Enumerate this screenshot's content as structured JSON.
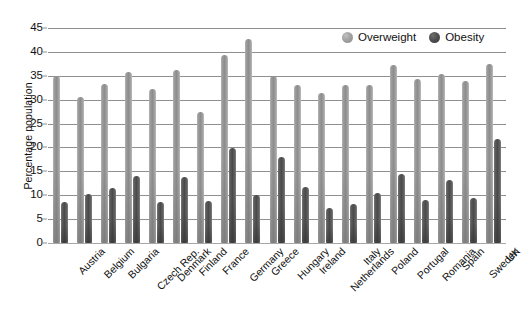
{
  "chart_data": {
    "type": "bar",
    "title": "",
    "xlabel": "",
    "ylabel": "Percentage population",
    "ylim": [
      0,
      45
    ],
    "yticks": [
      0,
      5,
      10,
      15,
      20,
      25,
      30,
      35,
      40,
      45
    ],
    "grid": true,
    "legend_position": "top-right-inside",
    "categories": [
      "Austria",
      "Belgium",
      "Bulgaria",
      "Czech Rep.",
      "Denmark",
      "Finland",
      "France",
      "Germany",
      "Greece",
      "Hungary",
      "Ireland",
      "Netherlands",
      "Italy",
      "Poland",
      "Portugal",
      "Romania",
      "Spain",
      "Sweden",
      "UK"
    ],
    "series": [
      {
        "name": "Overweight",
        "color": "#9b9b9b",
        "values": [
          35.0,
          30.5,
          33.2,
          35.8,
          32.3,
          36.3,
          27.5,
          39.3,
          42.8,
          35.0,
          33.0,
          31.3,
          33.0,
          33.0,
          37.3,
          34.3,
          35.3,
          34.0,
          37.5
        ]
      },
      {
        "name": "Obesity",
        "color": "#4f4f4f",
        "values": [
          8.5,
          10.3,
          11.5,
          14.0,
          8.6,
          13.8,
          8.7,
          19.8,
          10.0,
          18.0,
          11.7,
          7.3,
          8.2,
          10.5,
          14.5,
          9.0,
          13.2,
          9.5,
          21.8
        ]
      }
    ]
  },
  "legend": {
    "items": [
      {
        "label": "Overweight",
        "swatch": "overweight-swatch-icon"
      },
      {
        "label": "Obesity",
        "swatch": "obesity-swatch-icon"
      }
    ]
  },
  "axes": {
    "y_title": "Percentage population"
  }
}
